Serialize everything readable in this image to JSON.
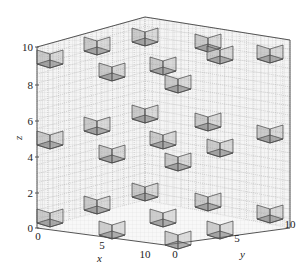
{
  "chart_data": {
    "type": "scatter3d",
    "title": "",
    "xlabel": "x",
    "ylabel": "y",
    "zlabel": "z",
    "xlim": [
      0,
      10
    ],
    "ylim": [
      0,
      10
    ],
    "zlim": [
      0,
      10
    ],
    "x_ticks": [
      "0",
      "5",
      "10"
    ],
    "y_ticks": [
      "0",
      "5",
      "10"
    ],
    "z_ticks": [
      "0",
      "2",
      "4",
      "6",
      "8",
      "10"
    ],
    "grid": true,
    "cube_size": 1,
    "colors": {
      "frame": "#555555",
      "cube_face": "#9a9a9a",
      "cube_edge": "#444444",
      "grid": "#bbbbbb"
    },
    "cubes_screen": [
      [
        50,
        57
      ],
      [
        97,
        44
      ],
      [
        145,
        35
      ],
      [
        208,
        41
      ],
      [
        270,
        52
      ],
      [
        112,
        70
      ],
      [
        163,
        64
      ],
      [
        220,
        53
      ],
      [
        178,
        82
      ],
      [
        50,
        138
      ],
      [
        97,
        124
      ],
      [
        145,
        112
      ],
      [
        208,
        120
      ],
      [
        270,
        132
      ],
      [
        112,
        152
      ],
      [
        163,
        138
      ],
      [
        220,
        146
      ],
      [
        178,
        160
      ],
      [
        50,
        216
      ],
      [
        97,
        203
      ],
      [
        145,
        190
      ],
      [
        208,
        200
      ],
      [
        270,
        212
      ],
      [
        112,
        228
      ],
      [
        163,
        216
      ],
      [
        220,
        228
      ],
      [
        178,
        238
      ]
    ]
  },
  "axes": {
    "x_label": "x",
    "y_label": "y",
    "z_label": "z",
    "z_ticks": [
      {
        "label": "10",
        "y": 47
      },
      {
        "label": "8",
        "y": 85
      },
      {
        "label": "6",
        "y": 121
      },
      {
        "label": "4",
        "y": 157
      },
      {
        "label": "2",
        "y": 193
      },
      {
        "label": "0",
        "y": 228
      }
    ],
    "x_ticks": [
      {
        "label": "0",
        "x": 38,
        "y": 240
      },
      {
        "label": "5",
        "x": 102,
        "y": 249
      },
      {
        "label": "10",
        "x": 145,
        "y": 258
      }
    ],
    "y_ticks": [
      {
        "label": "0",
        "x": 175,
        "y": 258
      },
      {
        "label": "5",
        "x": 237,
        "y": 242
      },
      {
        "label": "10",
        "x": 290,
        "y": 228
      }
    ]
  }
}
